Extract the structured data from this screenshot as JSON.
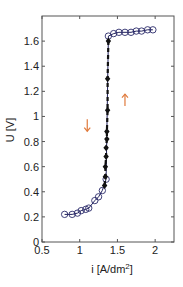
{
  "chart_data": {
    "type": "line",
    "title": "",
    "xlabel": "i [A/dm2]",
    "xlabel_main": "i [A/dm",
    "xlabel_sup": "2",
    "xlabel_end": "]",
    "ylabel": "U [V]",
    "xlim": [
      0.5,
      2.25
    ],
    "ylim": [
      0,
      1.8
    ],
    "grid": false,
    "legend": null,
    "x_ticks": [
      0.5,
      1,
      1.5,
      2
    ],
    "x_tick_labels": [
      "0.5",
      "1",
      "1.5",
      "2"
    ],
    "y_ticks": [
      0,
      0.2,
      0.4,
      0.6,
      0.8,
      1,
      1.2,
      1.4,
      1.6
    ],
    "y_tick_labels": [
      "0",
      "0.2",
      "0.4",
      "0.6",
      "0.8",
      "1",
      "1.2",
      "1.4",
      "1.6"
    ],
    "series": [
      {
        "name": "increasing current (open circles)",
        "marker": "circle-open",
        "line": "solid",
        "color": "#1f1f5a",
        "x": [
          0.8,
          0.9,
          0.97,
          1.02,
          1.08,
          1.12,
          1.2,
          1.25,
          1.3,
          1.35,
          1.38,
          1.45,
          1.52,
          1.6,
          1.68,
          1.75,
          1.82,
          1.9,
          1.97
        ],
        "y": [
          0.22,
          0.22,
          0.23,
          0.25,
          0.26,
          0.27,
          0.33,
          0.36,
          0.41,
          0.5,
          1.64,
          1.66,
          1.67,
          1.67,
          1.67,
          1.68,
          1.68,
          1.69,
          1.69
        ]
      },
      {
        "name": "decreasing current (filled diamonds)",
        "marker": "diamond-filled",
        "line": "dashed",
        "color": "#111111",
        "x": [
          1.38,
          1.37,
          1.37,
          1.36,
          1.36,
          1.35,
          1.35,
          1.34,
          1.34,
          1.33
        ],
        "y": [
          1.6,
          1.3,
          1.05,
          0.88,
          0.82,
          0.75,
          0.68,
          0.6,
          0.52,
          0.45
        ]
      }
    ],
    "annotations": [
      {
        "type": "arrow",
        "direction": "down",
        "x": 1.1,
        "y": 0.93,
        "color": "#e07a3c"
      },
      {
        "type": "arrow",
        "direction": "up",
        "x": 1.6,
        "y": 1.13,
        "color": "#e07a3c"
      }
    ]
  }
}
